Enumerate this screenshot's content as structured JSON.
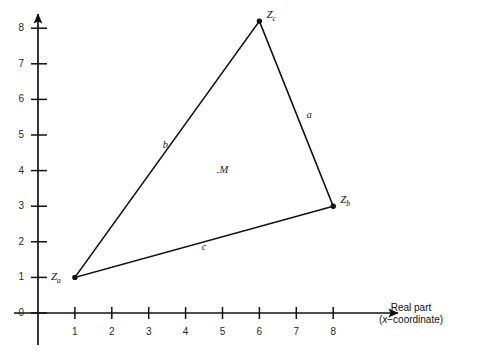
{
  "figure": {
    "background_color": "#ffffff",
    "ink_color": "#111111"
  },
  "axes": {
    "x_axis": {
      "name": "real-axis",
      "title_line1": "Real part",
      "title_line2_prefix": "(",
      "title_line2_italic": "x",
      "title_line2_suffix": "−coordinate)",
      "ticks": [
        "1",
        "2",
        "3",
        "4",
        "5",
        "6",
        "7",
        "8"
      ],
      "tick_values": [
        1,
        2,
        3,
        4,
        5,
        6,
        7,
        8
      ],
      "range": [
        0,
        9.4
      ],
      "arrow": "right"
    },
    "y_axis": {
      "name": "imaginary-axis",
      "ticks": [
        "0",
        "1",
        "2",
        "3",
        "4",
        "5",
        "6",
        "7",
        "8"
      ],
      "tick_values": [
        0,
        1,
        2,
        3,
        4,
        5,
        6,
        7,
        8
      ],
      "range": [
        -0.9,
        8.9
      ],
      "arrow": "up"
    }
  },
  "chart_data": {
    "type": "scatter",
    "title": "",
    "xlabel": "Real part (x−coordinate)",
    "ylabel": "",
    "xlim": [
      0,
      9.4
    ],
    "ylim": [
      -0.9,
      8.9
    ],
    "grid": false,
    "legend": "none",
    "points": [
      {
        "id": "Za",
        "label": "Z",
        "sub": "a",
        "x": 1.0,
        "y": 1.0,
        "marker": "dot",
        "label_pos": "left"
      },
      {
        "id": "Zb",
        "label": "Z",
        "sub": "b",
        "x": 8.0,
        "y": 3.0,
        "marker": "dot",
        "label_pos": "right"
      },
      {
        "id": "Zc",
        "label": "Z",
        "sub": "c",
        "x": 6.0,
        "y": 8.2,
        "marker": "dot",
        "label_pos": "right"
      }
    ],
    "polygon": {
      "name": "triangle",
      "vertices": [
        "Za",
        "Zc",
        "Zb"
      ],
      "closed": true,
      "fill": "none",
      "stroke": "#111111",
      "stroke_width": 1.6
    },
    "edge_labels": [
      {
        "label": "a",
        "between": [
          "Zc",
          "Zb"
        ],
        "x": 7.35,
        "y": 5.55
      },
      {
        "label": "b",
        "between": [
          "Za",
          "Zc"
        ],
        "x": 3.45,
        "y": 4.72
      },
      {
        "label": "c",
        "between": [
          "Za",
          "Zb"
        ],
        "x": 4.5,
        "y": 1.86
      }
    ],
    "annotations": [
      {
        "id": "M",
        "text": ".M",
        "x": 5.0,
        "y": 4.03,
        "italic": true
      }
    ]
  }
}
